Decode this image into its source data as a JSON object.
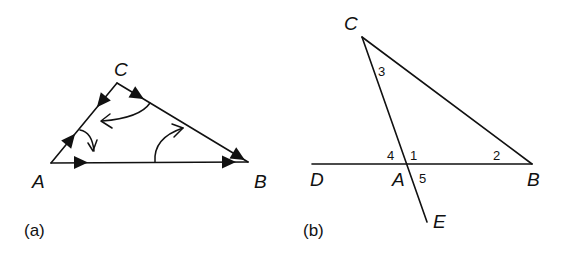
{
  "figure_a": {
    "caption": "(a)",
    "vertices": {
      "A": {
        "label": "A",
        "x": 51,
        "y": 163
      },
      "B": {
        "label": "B",
        "x": 248,
        "y": 162
      },
      "C": {
        "label": "C",
        "x": 117,
        "y": 83
      }
    },
    "description": "Triangle ABC with directed side arrows and three curved arrows indicating rotation of angles"
  },
  "figure_b": {
    "caption": "(b)",
    "points": {
      "C": {
        "label": "C",
        "x": 362,
        "y": 37
      },
      "D": {
        "label": "D",
        "x": 312,
        "y": 164
      },
      "A": {
        "label": "A",
        "x": 406,
        "y": 164
      },
      "B": {
        "label": "B",
        "x": 532,
        "y": 164
      },
      "E": {
        "label": "E",
        "x": 427,
        "y": 222
      }
    },
    "angle_labels": [
      "1",
      "2",
      "3",
      "4",
      "5"
    ],
    "description": "Triangle ABC with side BA extended to D and side CA extended to E; angles numbered 1-5"
  }
}
